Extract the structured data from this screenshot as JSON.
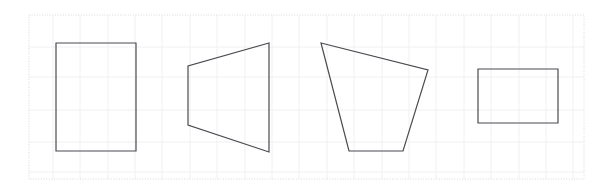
{
  "figure": {
    "title": "",
    "background_color": "#ffffff",
    "plot_area": {
      "x": 29,
      "y": 15,
      "width": 555,
      "height": 164,
      "border_color": "#d8d8dc",
      "border_style": "dotted"
    },
    "grid": {
      "visible": true,
      "color": "#f0f0f2",
      "x_lines": [
        53,
        80,
        108,
        135,
        162,
        190,
        217,
        245,
        272,
        299,
        327,
        354,
        382,
        409,
        436,
        464,
        491,
        519,
        546,
        573
      ],
      "y_lines": [
        47,
        77,
        110,
        142,
        172
      ]
    },
    "shape_style": {
      "stroke_color": "#4a4a52",
      "stroke_width": 1.2,
      "fill_color": "none"
    }
  },
  "chart_data": {
    "type": "scatter",
    "title": "",
    "xlabel": "",
    "ylabel": "",
    "xlim": [
      0,
      611
    ],
    "ylim": [
      193,
      0
    ],
    "grid": true,
    "legend": "none",
    "shapes": [
      {
        "name": "rectangle-upright",
        "kind": "rectangle",
        "vertex_count": 4,
        "points": [
          [
            56,
            43
          ],
          [
            136,
            43
          ],
          [
            136,
            151
          ],
          [
            56,
            151
          ]
        ]
      },
      {
        "name": "trapezoid-left-pointing",
        "kind": "trapezoid",
        "vertex_count": 4,
        "points": [
          [
            269,
            43
          ],
          [
            269,
            152
          ],
          [
            188,
            125
          ],
          [
            188,
            66
          ]
        ]
      },
      {
        "name": "quadrilateral-irregular",
        "kind": "quadrilateral",
        "vertex_count": 4,
        "points": [
          [
            321,
            43
          ],
          [
            428,
            70
          ],
          [
            403,
            151
          ],
          [
            349,
            151
          ]
        ]
      },
      {
        "name": "rectangle-wide",
        "kind": "rectangle",
        "vertex_count": 4,
        "points": [
          [
            478,
            69
          ],
          [
            558,
            69
          ],
          [
            558,
            123
          ],
          [
            478,
            123
          ]
        ]
      }
    ]
  }
}
